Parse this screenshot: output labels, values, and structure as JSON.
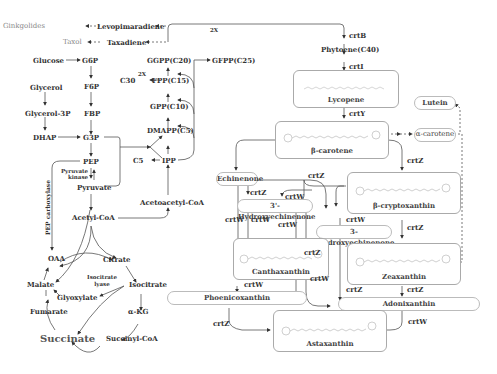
{
  "diagram": {
    "type": "metabolic-pathway",
    "terpenoid_branch": {
      "ginkgolides": "Ginkgolides",
      "levopimaradiene": "Levopimaradiene",
      "taxol": "Taxol",
      "taxadiene": "Taxadiene",
      "twox_top": "2X",
      "twox_fpp": "2X"
    },
    "glycolysis": {
      "glucose": "Glucose",
      "g6p": "G6P",
      "f6p": "F6P",
      "fbp": "FBP",
      "glycerol": "Glycerol",
      "glycerol3p": "Glycerol-3P",
      "dhap": "DHAP",
      "g3p": "G3P",
      "pep": "PEP",
      "pyruvate_kinase": "Pyruvate kinase",
      "pyruvate": "Pyruvate",
      "acetyl_coa": "Acetyl-CoA",
      "pep_carboxylase": "PEP carboxylase"
    },
    "isoprenoid": {
      "ggpp": "GGPP(C20)",
      "gfpp": "GFPP(C25)",
      "c30": "C30",
      "fpp": "FPP(C15)",
      "gpp": "GPP(C10)",
      "dmapp": "DMAPP(C5)",
      "c5": "C5",
      "ipp": "IPP",
      "acetoacetyl_coa": "Acetoacetyl-CoA"
    },
    "tca": {
      "oaa": "OAA",
      "citrate": "Citrate",
      "malate": "Malate",
      "isocitrate_lyase": "Isocitrate lyase",
      "isocitrate": "Isocitrate",
      "glyoxylate": "Glyoxylate",
      "fumarate": "Fumarate",
      "akg": "α-KG",
      "succinate": "Succinate",
      "succinyl_coa": "Succinyl-CoA"
    },
    "carotenoid": {
      "phytoene": "Phytoene(C40)",
      "lycopene": "Lycopene",
      "beta_carotene": "β-carotene",
      "alpha_carotene": "α-carotene",
      "lutein": "Lutein",
      "echinenone": "Echinenone",
      "hydroxyechinenone_3p": "3'-Hydroxyechinenone",
      "hydroxyechinenone_3": "3-Hydroxyechinenone",
      "beta_cryptoxanthin": "β-cryptoxanthin",
      "canthaxanthin": "Canthaxanthin",
      "zeaxanthin": "Zeaxanthin",
      "phoenicoxanthin": "Phoenicoxanthin",
      "adonixanthin": "Adonixanthin",
      "astaxanthin": "Astaxanthin"
    },
    "enzymes": {
      "crtB": "crtB",
      "crtI": "crtI",
      "crtY": "crtY",
      "crtZ": "crtZ",
      "crtW": "crtW"
    }
  }
}
